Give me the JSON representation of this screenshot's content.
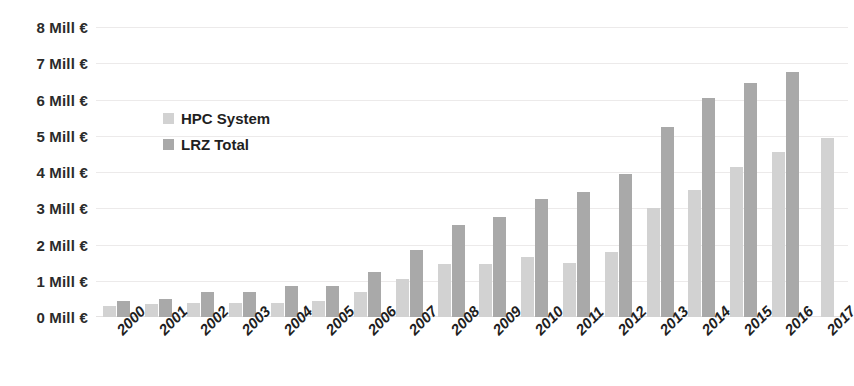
{
  "chart_data": {
    "type": "bar",
    "title": "",
    "subtitle": "",
    "xlabel": "",
    "ylabel": "",
    "ylim": [
      0,
      8
    ],
    "ytick_step": 1,
    "ytick_labels": [
      "8 Mill €",
      "7 Mill €",
      "6 Mill €",
      "5 Mill €",
      "4 Mill €",
      "3 Mill €",
      "2 Mill €",
      "1 Mill €",
      "0 Mill €"
    ],
    "ytick_values": [
      8,
      7,
      6,
      5,
      4,
      3,
      2,
      1,
      0
    ],
    "unit": "Mill €",
    "grid": true,
    "legend_position": "inside-top-left",
    "categories": [
      "2000",
      "2001",
      "2002",
      "2003",
      "2004",
      "2005",
      "2006",
      "2007",
      "2008",
      "2009",
      "2010",
      "2011",
      "2012",
      "2013",
      "2014",
      "2015",
      "2016",
      "2017"
    ],
    "series": [
      {
        "name": "HPC System",
        "color": "#d2d2d2",
        "values": [
          0.3,
          0.35,
          0.4,
          0.4,
          0.4,
          0.45,
          0.7,
          1.05,
          1.45,
          1.45,
          1.65,
          1.5,
          1.8,
          3.0,
          3.5,
          4.15,
          4.55,
          4.95
        ]
      },
      {
        "name": "LRZ Total",
        "color": "#a9a9a9",
        "values": [
          0.45,
          0.5,
          0.7,
          0.7,
          0.85,
          0.85,
          1.25,
          1.85,
          2.55,
          2.75,
          3.25,
          3.45,
          3.95,
          5.25,
          6.05,
          6.45,
          6.75,
          null
        ]
      }
    ]
  },
  "legend": {
    "items": [
      {
        "label": "HPC System",
        "swatch": "hpc"
      },
      {
        "label": "LRZ Total",
        "swatch": "lrz"
      }
    ]
  }
}
